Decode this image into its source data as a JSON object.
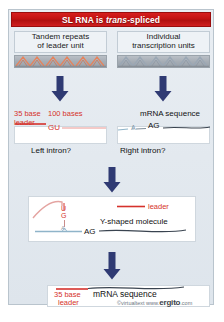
{
  "figure": {
    "title": {
      "prefix": "SL RNA is ",
      "italic": "trans",
      "suffix": "-spliced"
    },
    "columns": [
      {
        "name": "tandem-repeats",
        "line1": "Tandem repeats",
        "line2": "of leader unit",
        "repeat_color": "#e8825a",
        "repeat_count": 6
      },
      {
        "name": "transcription-units",
        "line1": "Individual",
        "line2": "transcription units",
        "repeat_color": "#9aa6b4",
        "repeat_count": 6
      }
    ],
    "arrows": [
      {
        "name": "arrow-left-top"
      },
      {
        "name": "arrow-right-top"
      },
      {
        "name": "arrow-middle"
      },
      {
        "name": "arrow-bottom"
      }
    ],
    "stage2": {
      "leader_len": "35 base",
      "leader_word": "leader",
      "intron_len": "100 bases",
      "donor": "GU",
      "branch": "A",
      "acceptor": "AG",
      "mrna_label": "mRNA sequence",
      "left_question": "Left intron?",
      "right_question": "Right intron?"
    },
    "stage3": {
      "u": "U",
      "g": "G",
      "branch": "A",
      "acceptor": "AG",
      "legend_label": "leader",
      "caption": "Y-shaped molecule"
    },
    "stage4": {
      "leader_len": "35 base",
      "leader_word": "leader",
      "mrna_label": "mRNA sequence"
    },
    "credit": {
      "copyright": "©virtualtext  www.",
      "brand": "ergito",
      "tld": ".com"
    },
    "colors": {
      "title_red": "#c21212",
      "accent_red": "#d5322c",
      "arrow_navy": "#2f3a73",
      "rna_blue": "#8fb4c9",
      "panel_bg": "#e5ebf1"
    }
  }
}
